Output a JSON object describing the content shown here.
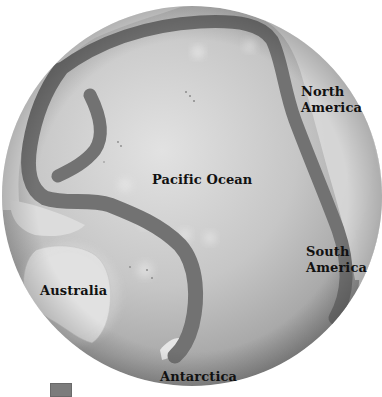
{
  "figure": {
    "globe": {
      "center_x": 192,
      "center_y": 196,
      "radius": 190,
      "ocean_color": "#c9c9c9",
      "ocean_highlight": "#e4e4e4",
      "land_color": "#dcdcdc",
      "band_color": "#727272",
      "shadow_color": "#8a8a8a"
    },
    "labels": {
      "pacific_ocean": "Pacific Ocean",
      "north_america_line1": "North",
      "north_america_line2": "America",
      "south_america_line1": "South",
      "south_america_line2": "America",
      "australia": "Australia",
      "antarctica": "Antarctica"
    },
    "legend": {
      "swatch_color": "#7c7c7c",
      "label": ""
    }
  }
}
